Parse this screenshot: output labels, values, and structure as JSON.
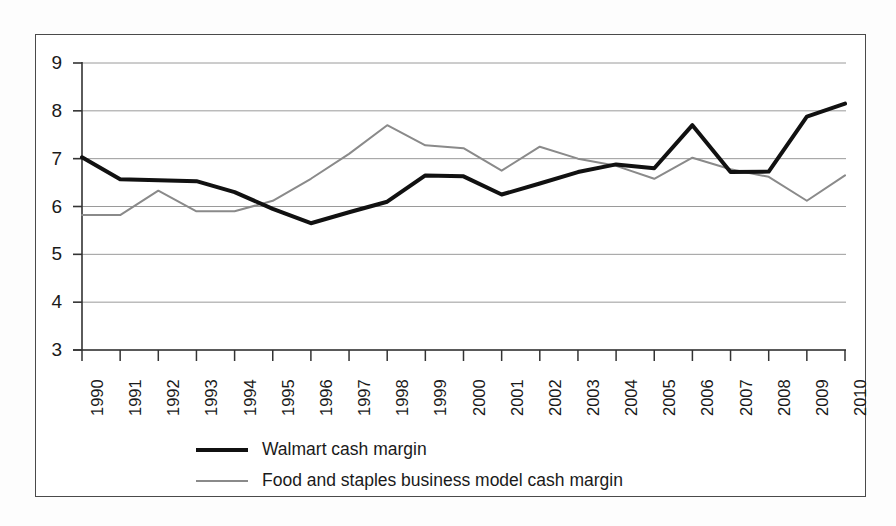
{
  "chart_data": {
    "type": "line",
    "title": "",
    "xlabel": "",
    "ylabel": "",
    "ylim": [
      3,
      9
    ],
    "yticks": [
      3,
      4,
      5,
      6,
      7,
      8,
      9
    ],
    "grid": true,
    "legend_position": "bottom",
    "categories": [
      "1990",
      "1991",
      "1992",
      "1993",
      "1994",
      "1995",
      "1996",
      "1997",
      "1998",
      "1999",
      "2000",
      "2001",
      "2002",
      "2003",
      "2004",
      "2005",
      "2006",
      "2007",
      "2008",
      "2009",
      "2010"
    ],
    "series": [
      {
        "name": "Walmart cash margin",
        "color": "#111111",
        "line_width": 4,
        "values": [
          7.03,
          6.57,
          6.55,
          6.53,
          6.3,
          5.95,
          5.65,
          5.88,
          6.1,
          6.65,
          6.63,
          6.25,
          6.48,
          6.72,
          6.88,
          6.8,
          7.7,
          6.72,
          6.73,
          7.88,
          8.15
        ]
      },
      {
        "name": "Food and staples business model cash margin",
        "color": "#8a8a8a",
        "line_width": 2,
        "values": [
          5.82,
          5.82,
          6.33,
          5.9,
          5.9,
          6.12,
          6.58,
          7.1,
          7.7,
          7.28,
          7.22,
          6.75,
          7.25,
          7.0,
          6.85,
          6.58,
          7.02,
          6.78,
          6.62,
          6.12,
          6.65
        ]
      }
    ]
  },
  "axes": {
    "y_tick_labels": [
      "9",
      "8",
      "7",
      "6",
      "5",
      "4",
      "3"
    ],
    "x_tick_labels": [
      "1990",
      "1991",
      "1992",
      "1993",
      "1994",
      "1995",
      "1996",
      "1997",
      "1998",
      "1999",
      "2000",
      "2001",
      "2002",
      "2003",
      "2004",
      "2005",
      "2006",
      "2007",
      "2008",
      "2009",
      "2010"
    ]
  },
  "legend": {
    "items": [
      {
        "label": "Walmart cash margin"
      },
      {
        "label": "Food and staples business model cash margin"
      }
    ]
  }
}
